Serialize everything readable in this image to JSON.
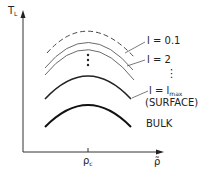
{
  "axes": {
    "y_label": "T",
    "y_label_sub": "L",
    "x_label": "ρ̃",
    "x_tick_label": "ρ",
    "x_tick_sub": "c"
  },
  "curves": {
    "l01": "l = 0.1",
    "l2": "l = 2",
    "lmax_prefix": "l = l",
    "lmax_sub": "max",
    "surface": "(SURFACE)",
    "bulk": "BULK"
  },
  "ellipsis": "⋮"
}
